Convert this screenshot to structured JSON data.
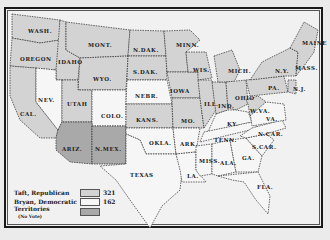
{
  "colors": {
    "republican": "#d3d3d3",
    "democratic": "#f6f6f6",
    "territory": "#a9a9a9",
    "border": "#2a2a2a",
    "water": "#efefef"
  },
  "legend": {
    "items": [
      {
        "label": "Taft, Republican",
        "count": "321",
        "swatch": "republican"
      },
      {
        "label": "Bryan, Democratic",
        "count": "162",
        "swatch": "democratic"
      },
      {
        "label": "Territories",
        "note": "(No Vote)",
        "swatch": "territory"
      }
    ]
  },
  "states": [
    {
      "label": "WASH.",
      "party": "republican",
      "x": 28,
      "y": 28
    },
    {
      "label": "OREGON",
      "party": "republican",
      "x": 20,
      "y": 56
    },
    {
      "label": "IDAHO",
      "party": "republican",
      "x": 58,
      "y": 59
    },
    {
      "label": "MONT.",
      "party": "democratic",
      "x": 88,
      "y": 42
    },
    {
      "label": "WYO.",
      "party": "republican",
      "x": 93,
      "y": 76
    },
    {
      "label": "NEV.",
      "party": "democratic",
      "x": 38,
      "y": 97
    },
    {
      "label": "CAL.",
      "party": "republican",
      "x": 20,
      "y": 111
    },
    {
      "label": "UTAH",
      "party": "republican",
      "x": 67,
      "y": 101
    },
    {
      "label": "COLO.",
      "party": "democratic",
      "x": 101,
      "y": 113
    },
    {
      "label": "ARIZ.",
      "party": "territory",
      "x": 62,
      "y": 146
    },
    {
      "label": "N.MEX.",
      "party": "territory",
      "x": 95,
      "y": 146
    },
    {
      "label": "N.DAK.",
      "party": "republican",
      "x": 133,
      "y": 47
    },
    {
      "label": "S.DAK.",
      "party": "republican",
      "x": 133,
      "y": 69
    },
    {
      "label": "NEBR.",
      "party": "democratic",
      "x": 135,
      "y": 93
    },
    {
      "label": "KANS.",
      "party": "republican",
      "x": 136,
      "y": 117
    },
    {
      "label": "OKLA.",
      "party": "democratic",
      "x": 149,
      "y": 140
    },
    {
      "label": "TEXAS",
      "party": "democratic",
      "x": 130,
      "y": 172
    },
    {
      "label": "MINN.",
      "party": "republican",
      "x": 176,
      "y": 42
    },
    {
      "label": "IOWA",
      "party": "republican",
      "x": 170,
      "y": 88
    },
    {
      "label": "WIS.",
      "party": "republican",
      "x": 193,
      "y": 67
    },
    {
      "label": "MO.",
      "party": "republican",
      "x": 181,
      "y": 118
    },
    {
      "label": "ARK.",
      "party": "democratic",
      "x": 180,
      "y": 141
    },
    {
      "label": "LA.",
      "party": "democratic",
      "x": 187,
      "y": 173
    },
    {
      "label": "ILL.",
      "party": "republican",
      "x": 204,
      "y": 101
    },
    {
      "label": "MICH.",
      "party": "republican",
      "x": 228,
      "y": 68
    },
    {
      "label": "IND.",
      "party": "republican",
      "x": 218,
      "y": 103
    },
    {
      "label": "OHIO",
      "party": "republican",
      "x": 235,
      "y": 95
    },
    {
      "label": "KY.",
      "party": "democratic",
      "x": 227,
      "y": 121
    },
    {
      "label": "TENN.",
      "party": "democratic",
      "x": 214,
      "y": 137
    },
    {
      "label": "MISS.",
      "party": "democratic",
      "x": 199,
      "y": 158
    },
    {
      "label": "ALA.",
      "party": "democratic",
      "x": 220,
      "y": 160
    },
    {
      "label": "GA.",
      "party": "democratic",
      "x": 242,
      "y": 155
    },
    {
      "label": "FLA.",
      "party": "democratic",
      "x": 257,
      "y": 184
    },
    {
      "label": "S.CAR.",
      "party": "democratic",
      "x": 252,
      "y": 144
    },
    {
      "label": "N.CAR.",
      "party": "democratic",
      "x": 258,
      "y": 131
    },
    {
      "label": "VA.",
      "party": "democratic",
      "x": 266,
      "y": 116
    },
    {
      "label": "W.VA.",
      "party": "republican",
      "x": 250,
      "y": 108
    },
    {
      "label": "PA.",
      "party": "republican",
      "x": 268,
      "y": 85
    },
    {
      "label": "N.Y.",
      "party": "republican",
      "x": 275,
      "y": 68
    },
    {
      "label": "MAINE",
      "party": "republican",
      "x": 302,
      "y": 40
    },
    {
      "label": "MASS.",
      "party": "republican",
      "x": 295,
      "y": 65
    },
    {
      "label": "N.J.",
      "party": "republican",
      "x": 293,
      "y": 86
    }
  ]
}
